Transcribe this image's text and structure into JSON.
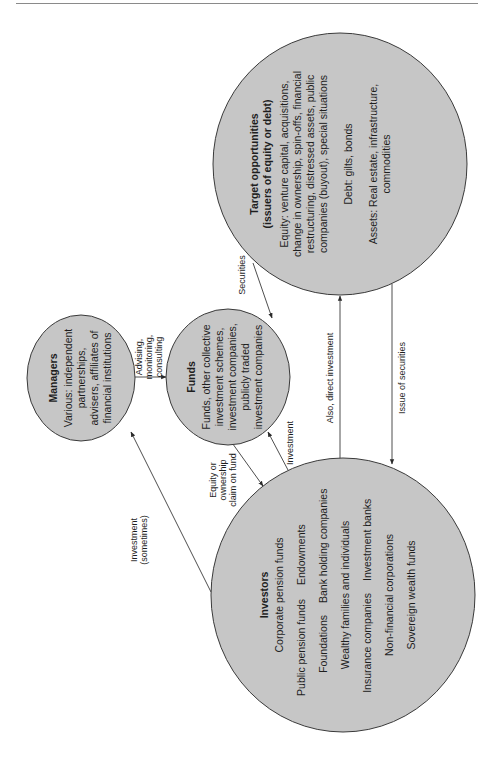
{
  "diagram": {
    "type": "flow",
    "orientation": "rotated-90-counterclockwise",
    "colors": {
      "node_fill": "#c6c6c6",
      "node_stroke": "#3a3a3a",
      "text": "#1e1e1e",
      "background": "#ffffff"
    },
    "nodes": {
      "target": {
        "title_1": "Target opportunities",
        "title_2": "(issuers of equity or debt)",
        "lines": [
          "Equity: venture capital, acquisitions,",
          "change in ownership, spin-offs, financial",
          "restructuring, distressed assets, public",
          "companies (buyout), special situations",
          "Debt: gilts, bonds",
          "Assets: Real estate, infrastructure,",
          "commodities"
        ]
      },
      "funds": {
        "title": "Funds",
        "lines": [
          "Funds, other collective",
          "investment schemes,",
          "investment companies,",
          "publicly traded",
          "investment companies"
        ]
      },
      "managers": {
        "title": "Managers",
        "lines": [
          "Various: independent",
          "partnerships,",
          "advisers, affiliates of",
          "financial institutions"
        ]
      },
      "investors": {
        "title": "Investors",
        "lines": [
          "Corporate pension funds",
          "Public pension funds",
          "Endowments",
          "Foundations",
          "Bank holding companies",
          "Wealthy families and individuals",
          "Insurance companies",
          "Investment banks",
          "Non-financial corporations",
          "Sovereign wealth funds"
        ]
      }
    },
    "edges": {
      "securities": {
        "from": "target",
        "to": "funds",
        "label": "Securities"
      },
      "advising": {
        "from": "managers",
        "to": "funds",
        "label_1": "Advising,",
        "label_2": "monitoring,",
        "label_3": "consulting"
      },
      "equity_claim": {
        "from": "funds",
        "to": "investors",
        "label_1": "Equity or",
        "label_2": "ownership",
        "label_3": "claim on fund"
      },
      "investment": {
        "from": "investors",
        "to": "funds",
        "label": "Investment"
      },
      "investment_sometimes": {
        "from": "investors",
        "to": "managers",
        "label_1": "Investment",
        "label_2": "(sometimes)"
      },
      "direct_investment": {
        "from": "investors",
        "to": "target",
        "label": "Also, direct investment"
      },
      "issue_securities": {
        "from": "target",
        "to": "investors",
        "label": "Issue of securities"
      }
    }
  }
}
